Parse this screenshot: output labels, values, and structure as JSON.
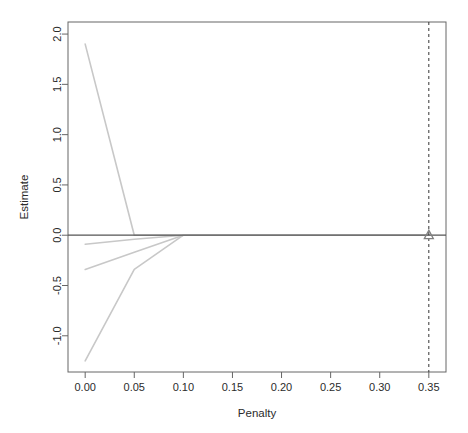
{
  "chart_data": {
    "type": "line",
    "title": "",
    "subtitle": "",
    "xlabel": "Penalty",
    "ylabel": "Estimate",
    "xlim": [
      -0.0175,
      0.3675
    ],
    "ylim": [
      -1.36,
      2.12
    ],
    "xticks": [
      0.0,
      0.05,
      0.1,
      0.15,
      0.2,
      0.25,
      0.3,
      0.35
    ],
    "xticklabels": [
      "0.00",
      "0.05",
      "0.10",
      "0.15",
      "0.20",
      "0.25",
      "0.30",
      "0.35"
    ],
    "yticks": [
      -1.0,
      -0.5,
      0.0,
      0.5,
      1.0,
      1.5,
      2.0
    ],
    "yticklabels": [
      "-1.0",
      "-0.5",
      "0.0",
      "0.5",
      "1.0",
      "1.5",
      "2.0"
    ],
    "grid": false,
    "legend": "none",
    "x": [
      0.0,
      0.05,
      0.1,
      0.15,
      0.2,
      0.25,
      0.3,
      0.35
    ],
    "series": [
      {
        "name": "coefficient-path-1",
        "color": "#c8c8c8",
        "values": [
          1.9,
          0.0,
          0.0,
          0.0,
          0.0,
          0.0,
          0.0,
          0.0
        ]
      },
      {
        "name": "coefficient-path-2",
        "color": "#c8c8c8",
        "values": [
          -0.09,
          -0.04,
          0.0,
          0.0,
          0.0,
          0.0,
          0.0,
          0.0
        ]
      },
      {
        "name": "coefficient-path-3",
        "color": "#c8c8c8",
        "values": [
          -0.34,
          -0.17,
          0.0,
          0.0,
          0.0,
          0.0,
          0.0,
          0.0
        ]
      },
      {
        "name": "coefficient-path-4",
        "color": "#c8c8c8",
        "values": [
          -1.25,
          -0.34,
          0.0,
          0.0,
          0.0,
          0.0,
          0.0,
          0.0
        ]
      }
    ],
    "reference_lines": [
      {
        "name": "zero-reference-line",
        "orientation": "horizontal",
        "value": 0.0,
        "style": "solid",
        "color": "#555555"
      },
      {
        "name": "selected-penalty-line",
        "orientation": "vertical",
        "value": 0.35,
        "style": "dashed",
        "color": "#333333"
      }
    ],
    "markers": [
      {
        "name": "selected-penalty-marker",
        "shape": "triangle",
        "x": 0.35,
        "y": 0.0,
        "color": "#808080"
      }
    ],
    "axis_color": "#666666",
    "background": "#ffffff"
  }
}
